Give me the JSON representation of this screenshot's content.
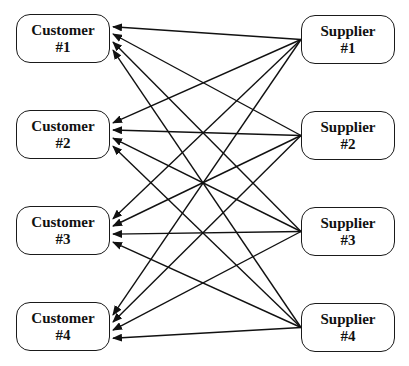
{
  "diagram": {
    "type": "bipartite-network",
    "customers": [
      {
        "id": "c1",
        "label": "Customer",
        "number": "#1",
        "box": [
          16,
          14,
          94,
          49
        ]
      },
      {
        "id": "c2",
        "label": "Customer",
        "number": "#2",
        "box": [
          16,
          110,
          94,
          49
        ]
      },
      {
        "id": "c3",
        "label": "Customer",
        "number": "#3",
        "box": [
          16,
          206,
          94,
          49
        ]
      },
      {
        "id": "c4",
        "label": "Customer",
        "number": "#4",
        "box": [
          16,
          302,
          94,
          49
        ]
      }
    ],
    "suppliers": [
      {
        "id": "s1",
        "label": "Supplier",
        "number": "#1",
        "box": [
          301,
          15,
          94,
          49
        ]
      },
      {
        "id": "s2",
        "label": "Supplier",
        "number": "#2",
        "box": [
          301,
          111,
          94,
          49
        ]
      },
      {
        "id": "s3",
        "label": "Supplier",
        "number": "#3",
        "box": [
          301,
          207,
          94,
          49
        ]
      },
      {
        "id": "s4",
        "label": "Supplier",
        "number": "#4",
        "box": [
          301,
          303,
          94,
          49
        ]
      }
    ],
    "edges": [
      {
        "from": "s1",
        "to": "c1"
      },
      {
        "from": "s1",
        "to": "c2"
      },
      {
        "from": "s1",
        "to": "c3"
      },
      {
        "from": "s1",
        "to": "c4"
      },
      {
        "from": "s2",
        "to": "c1"
      },
      {
        "from": "s2",
        "to": "c2"
      },
      {
        "from": "s2",
        "to": "c3"
      },
      {
        "from": "s2",
        "to": "c4"
      },
      {
        "from": "s3",
        "to": "c1"
      },
      {
        "from": "s3",
        "to": "c2"
      },
      {
        "from": "s3",
        "to": "c3"
      },
      {
        "from": "s3",
        "to": "c4"
      },
      {
        "from": "s4",
        "to": "c1"
      },
      {
        "from": "s4",
        "to": "c2"
      },
      {
        "from": "s4",
        "to": "c3"
      },
      {
        "from": "s4",
        "to": "c4"
      }
    ],
    "colors": {
      "line": "#111111",
      "border": "#1a1a1a",
      "background": "#ffffff"
    }
  }
}
